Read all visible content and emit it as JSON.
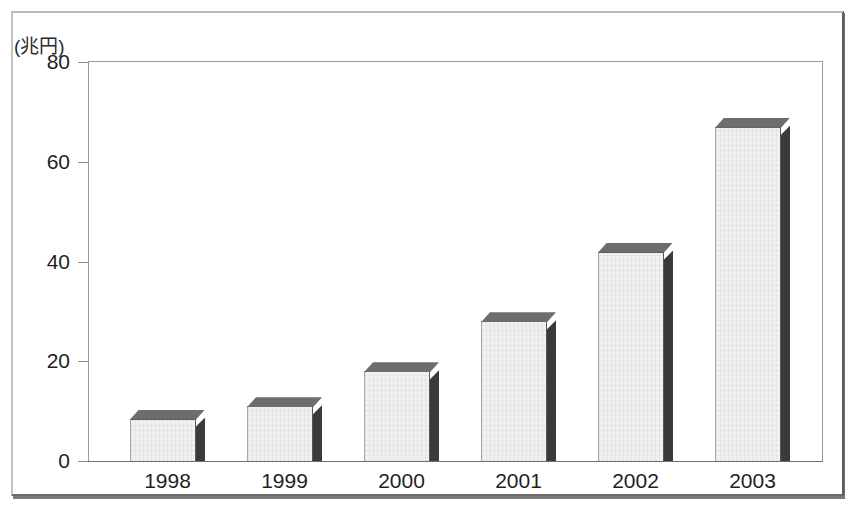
{
  "chart_data": {
    "type": "bar",
    "title": "",
    "subtitle": "",
    "xlabel": "",
    "ylabel": "(兆円)",
    "yunit_label": "(兆円)",
    "categories": [
      "1998",
      "1999",
      "2000",
      "2001",
      "2002",
      "2003"
    ],
    "values": [
      8.5,
      11,
      18,
      28,
      42,
      67
    ],
    "series": [
      {
        "name": "",
        "values": [
          8.5,
          11,
          18,
          28,
          42,
          67
        ]
      }
    ],
    "ylim": [
      0,
      80
    ],
    "yticks": [
      "0",
      "20",
      "40",
      "60",
      "80"
    ],
    "ytick_values": [
      0,
      20,
      40,
      60,
      80
    ],
    "grid": false,
    "legend": false,
    "legend_position": "none",
    "annotations": [],
    "style": {
      "bar_face_color": "#f1f1f1",
      "bar_top_color": "#6d6d6d",
      "bar_side_color": "#3a3a3a",
      "bar_outline_color": "#4b4b4b",
      "axis_color": "#9b9b9b",
      "text_color": "#1f1f1f",
      "background": "#ffffff",
      "three_d": true
    }
  }
}
